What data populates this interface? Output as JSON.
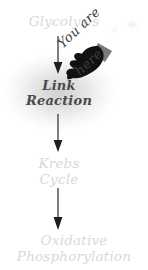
{
  "diagram": {
    "background_color": "#ffffff",
    "dim_text_color": "#d8d8d8",
    "active_text_color": "#4a4a4a",
    "arrow_color": "#3a3a3a",
    "cursor_color": "#111111",
    "cursor_cuff_color": "#7a7a7a",
    "stages": [
      {
        "id": "glycolysis",
        "label": "Glycolysis",
        "state": "dim"
      },
      {
        "id": "link",
        "label": "Link\nReaction",
        "state": "active"
      },
      {
        "id": "krebs",
        "label": "Krebs\nCycle",
        "state": "dim"
      },
      {
        "id": "oxphos",
        "label": "Oxidative\nPhosphorylation",
        "state": "dim"
      }
    ],
    "connectors": [
      {
        "id": "arrow-1",
        "from": "glycolysis",
        "to": "link",
        "direction": "down"
      },
      {
        "id": "arrow-2",
        "from": "link",
        "to": "krebs",
        "direction": "down"
      },
      {
        "id": "arrow-3",
        "from": "krebs",
        "to": "oxphos",
        "direction": "down"
      }
    ],
    "annotation": {
      "line_1": "You are",
      "line_2": "here",
      "rotation_deg": -43,
      "points_to": "link"
    },
    "cursor": {
      "icon": "pointing-hand-cursor",
      "points_to": "link"
    },
    "highlight": {
      "target": "link",
      "shape": "radial-glow"
    }
  }
}
